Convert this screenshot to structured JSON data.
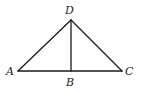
{
  "diagram": {
    "points": {
      "A": {
        "x": 18,
        "y": 71,
        "label": "A",
        "label_x": 6,
        "label_y": 75
      },
      "B": {
        "x": 71,
        "y": 71,
        "label": "B",
        "label_x": 66,
        "label_y": 86
      },
      "C": {
        "x": 122,
        "y": 71,
        "label": "C",
        "label_x": 125,
        "label_y": 75
      },
      "D": {
        "x": 71,
        "y": 20,
        "label": "D",
        "label_x": 65,
        "label_y": 14
      }
    },
    "segments": [
      {
        "name": "segment-AD",
        "from": "A",
        "to": "D"
      },
      {
        "name": "segment-DC",
        "from": "D",
        "to": "C"
      },
      {
        "name": "segment-AC",
        "from": "A",
        "to": "C"
      },
      {
        "name": "segment-DB",
        "from": "D",
        "to": "B"
      }
    ],
    "colors": {
      "stroke": "#1a1a1a",
      "background": "#ffffff"
    }
  }
}
